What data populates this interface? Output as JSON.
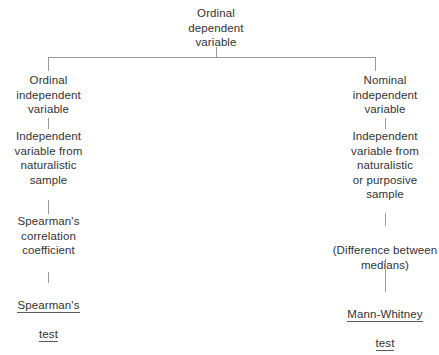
{
  "diagram": {
    "background_color": "#ffffff",
    "text_color": "#333333",
    "line_color": "#9a9a9a",
    "underline_color": "#5a5a5a"
  },
  "root": {
    "label": "Ordinal\ndependent\nvariable"
  },
  "branches": {
    "left": {
      "nodes": [
        {
          "label": "Ordinal\nindependent\nvariable"
        },
        {
          "label": "Independent\nvariable from\nnaturalistic\nsample"
        },
        {
          "label": "Spearman's\ncorrelation\ncoefficient"
        }
      ],
      "terminal": {
        "line1": "Spearman's",
        "line2": "test"
      }
    },
    "right": {
      "nodes": [
        {
          "label": "Nominal\nindependent\nvariable"
        },
        {
          "label": "Independent\nvariable from\nnaturalistic\nor purposive\nsample"
        },
        {
          "label": "(Difference between\nmedians)"
        }
      ],
      "terminal": {
        "line1": "Mann-Whitney",
        "line2": "test"
      }
    }
  }
}
